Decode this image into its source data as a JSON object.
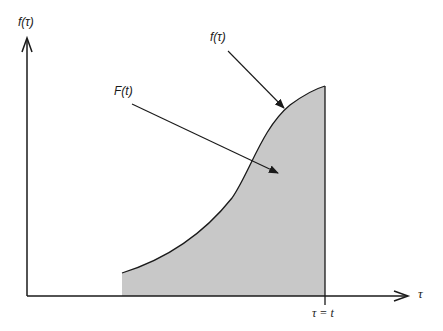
{
  "diagram": {
    "y_axis_label": "f(τ)",
    "x_axis_label": "τ",
    "curve_label": "f(τ)",
    "area_label": "F(t)",
    "upper_limit_label": "τ = t",
    "colors": {
      "area_fill": "#c8c8c8",
      "line": "#1a1a1a",
      "background": "#ffffff"
    }
  }
}
